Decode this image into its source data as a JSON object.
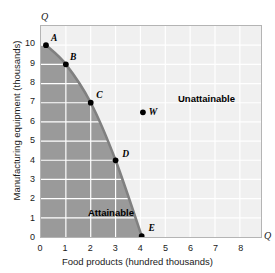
{
  "chart_data": {
    "type": "line",
    "title": "",
    "xlabel": "Food products (hundred thousands)",
    "ylabel": "Manufacturing equipment (thousands)",
    "xlim": [
      0,
      8.85
    ],
    "ylim": [
      0,
      11
    ],
    "xticks": [
      "0",
      "1",
      "2",
      "3",
      "4",
      "5",
      "6",
      "7",
      "8"
    ],
    "yticks": [
      "0",
      "1",
      "2",
      "3",
      "4",
      "5",
      "6",
      "7",
      "8",
      "9",
      "10"
    ],
    "xtick_values": [
      0,
      1,
      2,
      3,
      4,
      5,
      6,
      7,
      8
    ],
    "ytick_values": [
      0,
      1,
      2,
      3,
      4,
      5,
      6,
      7,
      8,
      9,
      10
    ],
    "grid": true,
    "legend": "none",
    "axis_end_markers": {
      "y_top": "Q",
      "x_right": "Q"
    },
    "series": [
      {
        "name": "Production possibilities frontier",
        "points": [
          {
            "label": "A",
            "x": 0.2,
            "y": 10.0
          },
          {
            "label": "B",
            "x": 1.0,
            "y": 9.0
          },
          {
            "label": "C",
            "x": 2.0,
            "y": 7.0
          },
          {
            "label": "D",
            "x": 3.0,
            "y": 4.0
          },
          {
            "label": "E",
            "x": 4.05,
            "y": 0.05
          }
        ]
      },
      {
        "name": "Unattainable point",
        "points": [
          {
            "label": "W",
            "x": 4.1,
            "y": 6.5
          }
        ]
      }
    ],
    "regions": [
      {
        "label": "Attainable",
        "color": "#9a9a9a"
      },
      {
        "label": "Unattainable",
        "color": "#f0f0f0"
      }
    ],
    "colors": {
      "curve": "#808080",
      "attainable_fill": "#9a9a9a",
      "unattainable_fill": "#f0f0f0",
      "gridline": "#ffffff",
      "point": "#000000",
      "frame": "#b4b4b4"
    }
  }
}
